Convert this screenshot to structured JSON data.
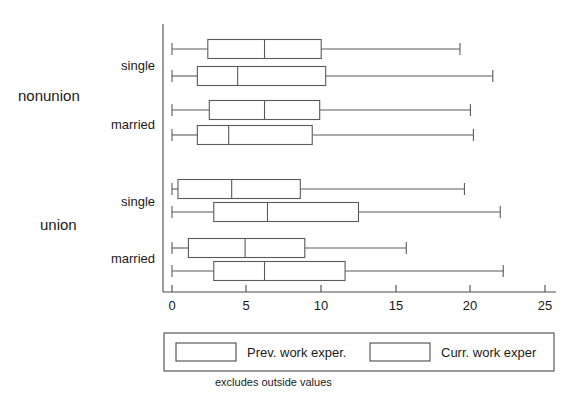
{
  "chart_data": {
    "type": "boxplot",
    "title": "",
    "xlabel": "",
    "ylabel": "",
    "xlim": [
      0,
      25
    ],
    "xticks": [
      0,
      5,
      10,
      15,
      20,
      25
    ],
    "xtick_labels": [
      "0",
      "5",
      "10",
      "15",
      "20",
      "25"
    ],
    "grid": false,
    "legend_position": "bottom",
    "footnote": "excludes outside values",
    "series": [
      {
        "name": "Prev. work exper.",
        "key": "prev"
      },
      {
        "name": "Curr. work exper",
        "key": "curr"
      }
    ],
    "groups": [
      {
        "label": "nonunion",
        "categories": [
          {
            "label": "single",
            "boxes": [
              {
                "series": "Prev. work exper.",
                "whisker_low": 0.0,
                "q1": 2.4,
                "median": 6.2,
                "q3": 10.0,
                "whisker_high": 19.3
              },
              {
                "series": "Curr. work exper",
                "whisker_low": 0.0,
                "q1": 1.7,
                "median": 4.4,
                "q3": 10.3,
                "whisker_high": 21.5
              }
            ]
          },
          {
            "label": "married",
            "boxes": [
              {
                "series": "Prev. work exper.",
                "whisker_low": 0.0,
                "q1": 2.5,
                "median": 6.2,
                "q3": 9.9,
                "whisker_high": 20.0
              },
              {
                "series": "Curr. work exper",
                "whisker_low": 0.0,
                "q1": 1.7,
                "median": 3.8,
                "q3": 9.4,
                "whisker_high": 20.2
              }
            ]
          }
        ]
      },
      {
        "label": "union",
        "categories": [
          {
            "label": "single",
            "boxes": [
              {
                "series": "Prev. work exper.",
                "whisker_low": 0.0,
                "q1": 0.4,
                "median": 4.0,
                "q3": 8.6,
                "whisker_high": 19.6
              },
              {
                "series": "Curr. work exper",
                "whisker_low": 0.0,
                "q1": 2.8,
                "median": 6.4,
                "q3": 12.5,
                "whisker_high": 22.0
              }
            ]
          },
          {
            "label": "married",
            "boxes": [
              {
                "series": "Prev. work exper.",
                "whisker_low": 0.0,
                "q1": 1.1,
                "median": 4.9,
                "q3": 8.9,
                "whisker_high": 15.7
              },
              {
                "series": "Curr. work exper",
                "whisker_low": 0.0,
                "q1": 2.8,
                "median": 6.2,
                "q3": 11.6,
                "whisker_high": 22.2
              }
            ]
          }
        ]
      }
    ]
  },
  "legend": {
    "items": [
      {
        "label": "Prev. work exper."
      },
      {
        "label": "Curr. work exper"
      }
    ],
    "footnote": "excludes outside values"
  },
  "axis": {
    "ticks": [
      {
        "label": "0",
        "value": 0
      },
      {
        "label": "5",
        "value": 5
      },
      {
        "label": "10",
        "value": 10
      },
      {
        "label": "15",
        "value": 15
      },
      {
        "label": "20",
        "value": 20
      },
      {
        "label": "25",
        "value": 25
      }
    ]
  },
  "labels": {
    "group_nonunion": "nonunion",
    "group_union": "union",
    "cat_nonunion_single": "single",
    "cat_nonunion_married": "married",
    "cat_union_single": "single",
    "cat_union_married": "married"
  },
  "colors": {
    "stroke": "#5a5a5a",
    "axis": "#4a4a4a",
    "background": "#ffffff",
    "text": "#1a1a1a"
  }
}
